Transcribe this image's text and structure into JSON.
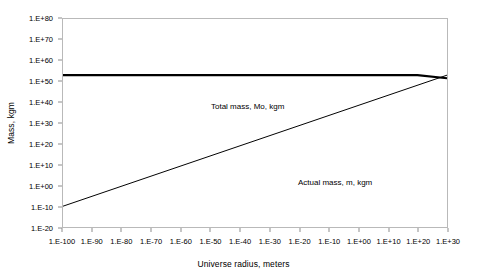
{
  "chart_data": {
    "type": "line",
    "title": "",
    "xlabel": "Universe radius, meters",
    "ylabel": "Mass, kgm",
    "x_scale": "log",
    "y_scale": "log",
    "grid": false,
    "legend_position": "inline-annotations",
    "xlim": [
      -100,
      30
    ],
    "ylim": [
      -20,
      80
    ],
    "x_tick_labels": [
      "1.E-100",
      "1.E-90",
      "1.E-80",
      "1.E-70",
      "1.E-60",
      "1.E-50",
      "1.E-40",
      "1.E-30",
      "1.E-20",
      "1.E-10",
      "1.E+00",
      "1.E+10",
      "1.E+20",
      "1.E+30"
    ],
    "x_tick_exponents": [
      -100,
      -90,
      -80,
      -70,
      -60,
      -50,
      -40,
      -30,
      -20,
      -10,
      0,
      10,
      20,
      30
    ],
    "y_tick_labels": [
      "1.E+80",
      "1.E+70",
      "1.E+60",
      "1.E+50",
      "1.E+40",
      "1.E+30",
      "1.E+20",
      "1.E+10",
      "1.E+00",
      "1.E-10",
      "1.E-20"
    ],
    "y_tick_exponents": [
      80,
      70,
      60,
      50,
      40,
      30,
      20,
      10,
      0,
      -10,
      -20
    ],
    "series": [
      {
        "name": "Total mass, Mo, kgm",
        "annotation": "Total mass, Mo, kgm",
        "color": "#000000",
        "line_width": 2.2,
        "x_exponents": [
          -100,
          20,
          30
        ],
        "y_exponents": [
          53,
          53,
          51.5
        ]
      },
      {
        "name": "Actual mass, m, kgm",
        "annotation": "Actual mass, m, kgm",
        "color": "#000000",
        "line_width": 1,
        "x_exponents": [
          -100,
          30
        ],
        "y_exponents": [
          -10,
          53
        ]
      }
    ]
  },
  "annotations": {
    "total_mass_label": "Total mass, Mo, kgm",
    "actual_mass_label": "Actual mass, m, kgm"
  },
  "axes": {
    "x_title": "Universe radius, meters",
    "y_title": "Mass, kgm"
  },
  "colors": {
    "background": "#ffffff",
    "plot_border": "#b9b9b9",
    "series_line": "#000000",
    "tick_mark": "#8d8d8d",
    "text": "#000000"
  }
}
